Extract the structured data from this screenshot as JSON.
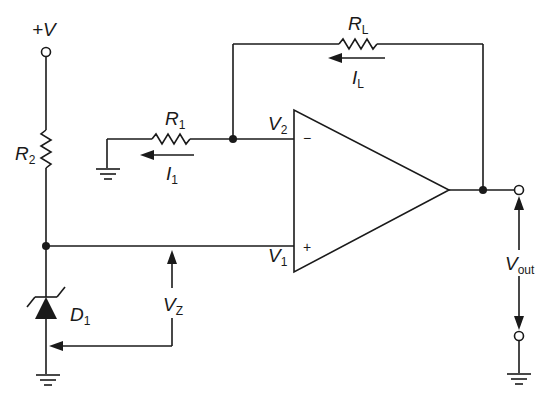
{
  "diagram": {
    "type": "op-amp constant current source circuit schematic",
    "labels": {
      "supply": "+V",
      "r2": {
        "main": "R",
        "sub": "2"
      },
      "r1": {
        "main": "R",
        "sub": "1"
      },
      "rl": {
        "main": "R",
        "sub": "L"
      },
      "i1": {
        "main": "I",
        "sub": "1"
      },
      "il": {
        "main": "I",
        "sub": "L"
      },
      "v1": {
        "main": "V",
        "sub": "1"
      },
      "v2": {
        "main": "V",
        "sub": "2"
      },
      "vz": {
        "main": "V",
        "sub": "Z"
      },
      "d1": {
        "main": "D",
        "sub": "1"
      },
      "vout": {
        "main": "V",
        "sub": "out"
      },
      "inverting_input": "−",
      "noninverting_input": "+"
    },
    "components": [
      {
        "id": "R2",
        "kind": "resistor",
        "between": [
          "+V",
          "node_V1"
        ]
      },
      {
        "id": "D1",
        "kind": "zener-diode",
        "between": [
          "node_V1",
          "ground"
        ]
      },
      {
        "id": "R1",
        "kind": "resistor",
        "between": [
          "ground",
          "node_V2"
        ]
      },
      {
        "id": "RL",
        "kind": "resistor",
        "between": [
          "node_V2",
          "output"
        ]
      },
      {
        "id": "U1",
        "kind": "op-amp",
        "inputs": {
          "minus": "node_V2",
          "plus": "node_V1"
        },
        "output": "output"
      }
    ],
    "colors": {
      "ink": "#1a1a1a",
      "background": "#ffffff"
    }
  }
}
